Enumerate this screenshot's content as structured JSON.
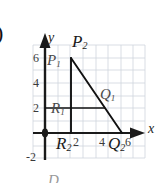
{
  "figure": {
    "item_marker": ")",
    "bottom_cut_text": "D"
  },
  "axes": {
    "x_label": "x",
    "y_label": "y",
    "x_ticks": [
      {
        "label": "2",
        "value": 2
      },
      {
        "label": "4",
        "value": 4
      },
      {
        "label": "6",
        "value": 6
      }
    ],
    "y_ticks": [
      {
        "label": "6",
        "value": 6
      },
      {
        "label": "4",
        "value": 4
      },
      {
        "label": "2",
        "value": 2
      },
      {
        "label": "-2",
        "value": -2
      }
    ],
    "x_min": 0,
    "x_max": 7,
    "y_min": -2,
    "y_max": 7,
    "grid": true,
    "grid_color": "#cfd4dd",
    "axis_color": "#1a1a1a",
    "origin_marker": true
  },
  "point_labels": [
    {
      "base": "P",
      "sub": "1",
      "kind": "small"
    },
    {
      "base": "P",
      "sub": "2",
      "kind": "large"
    },
    {
      "base": "R",
      "sub": "1",
      "kind": "small"
    },
    {
      "base": "R",
      "sub": "2",
      "kind": "large"
    },
    {
      "base": "Q",
      "sub": "1",
      "kind": "small"
    },
    {
      "base": "Q",
      "sub": "2",
      "kind": "large"
    }
  ],
  "shape": {
    "type": "right-triangle",
    "stroke": "#111111",
    "vertices": [
      {
        "name": "apex",
        "x": 2,
        "y": 6
      },
      {
        "name": "right-angle",
        "x": 2,
        "y": 0
      },
      {
        "name": "base-right",
        "x": 6,
        "y": 0
      }
    ],
    "segments": [
      {
        "name": "vertical-leg",
        "from": [
          2,
          6
        ],
        "to": [
          2,
          0
        ]
      },
      {
        "name": "hypotenuse",
        "from": [
          2,
          6
        ],
        "to": [
          6,
          0
        ]
      },
      {
        "name": "horizontal-chord",
        "from": [
          0,
          2
        ],
        "to": [
          4.67,
          2
        ]
      }
    ]
  }
}
